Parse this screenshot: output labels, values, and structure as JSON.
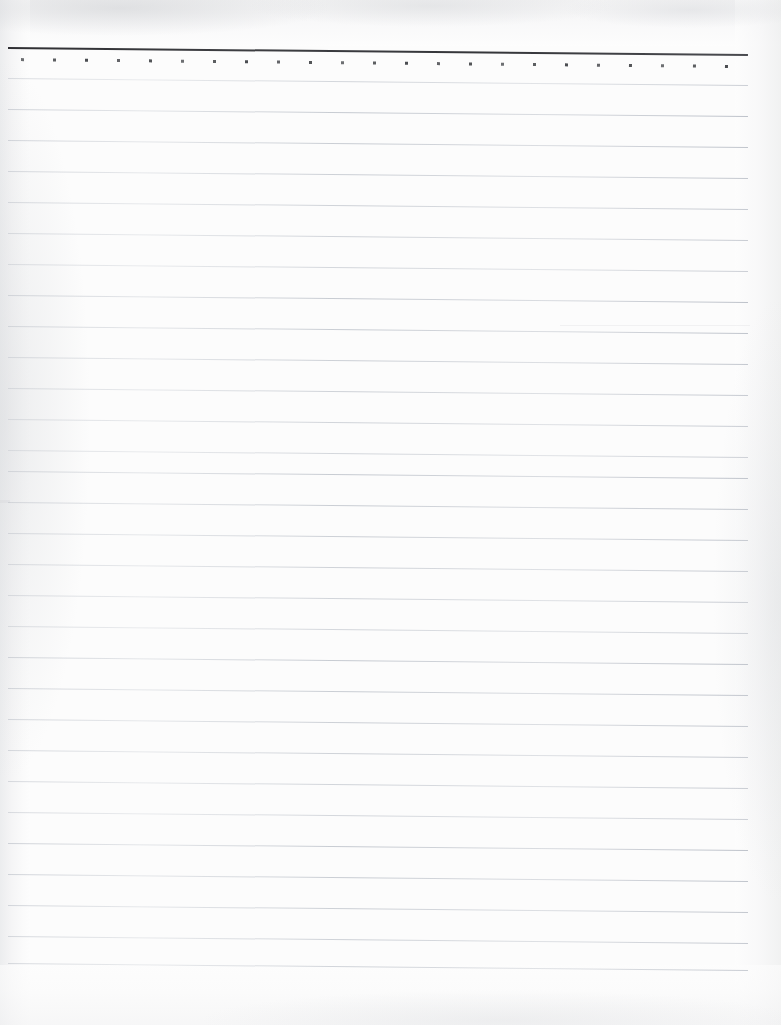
{
  "document": {
    "kind": "scanned-lined-notebook-page",
    "title": "Blank Ruled Notebook Page",
    "width_px": 781,
    "height_px": 1025,
    "background_color": "#fcfcfc",
    "content_text": "",
    "notes": "Blank ruled paper scan: one dark header rule with a row of small square dots beneath it, followed by evenly spaced faint horizontal ruling lines. No handwriting, text, or other marks present."
  },
  "colors": {
    "paper": "#fcfcfc",
    "header_rule": "#35363a",
    "dot": "#44464a",
    "ruled_line": "#c9ccd2",
    "scan_edge_shadow": "#e9eaec"
  },
  "geometry": {
    "tilt_degrees": 0.55,
    "rule_left_x": 8,
    "rule_width": 740,
    "header_rule_y": 47,
    "dot_row_y": 58,
    "dot_start_x": 21,
    "dot_spacing": 32,
    "dot_count": 23,
    "first_line_y": 78,
    "line_spacing": 31.3,
    "line_count": 29
  },
  "header_rule": {
    "label": "Header Rule",
    "thickness_px": 2
  },
  "dot_row": {
    "label": "Dot Marker Row",
    "dots": [
      {
        "index": 1
      },
      {
        "index": 2
      },
      {
        "index": 3
      },
      {
        "index": 4
      },
      {
        "index": 5
      },
      {
        "index": 6
      },
      {
        "index": 7
      },
      {
        "index": 8
      },
      {
        "index": 9
      },
      {
        "index": 10
      },
      {
        "index": 11
      },
      {
        "index": 12
      },
      {
        "index": 13
      },
      {
        "index": 14
      },
      {
        "index": 15
      },
      {
        "index": 16
      },
      {
        "index": 17
      },
      {
        "index": 18
      },
      {
        "index": 19
      },
      {
        "index": 20
      },
      {
        "index": 21
      },
      {
        "index": 22
      },
      {
        "index": 23
      }
    ]
  },
  "ruled_lines": {
    "label": "Ruled Writing Lines",
    "lines": [
      {
        "index": 1,
        "y": 78
      },
      {
        "index": 2,
        "y": 109
      },
      {
        "index": 3,
        "y": 140
      },
      {
        "index": 4,
        "y": 171
      },
      {
        "index": 5,
        "y": 202
      },
      {
        "index": 6,
        "y": 233
      },
      {
        "index": 7,
        "y": 264
      },
      {
        "index": 8,
        "y": 295
      },
      {
        "index": 9,
        "y": 326
      },
      {
        "index": 10,
        "y": 357
      },
      {
        "index": 11,
        "y": 388
      },
      {
        "index": 12,
        "y": 419
      },
      {
        "index": 13,
        "y": 450
      },
      {
        "index": 14,
        "y": 471
      },
      {
        "index": 15,
        "y": 502
      },
      {
        "index": 16,
        "y": 533
      },
      {
        "index": 17,
        "y": 564
      },
      {
        "index": 18,
        "y": 595
      },
      {
        "index": 19,
        "y": 626
      },
      {
        "index": 20,
        "y": 657
      },
      {
        "index": 21,
        "y": 688
      },
      {
        "index": 22,
        "y": 719
      },
      {
        "index": 23,
        "y": 750
      },
      {
        "index": 24,
        "y": 781
      },
      {
        "index": 25,
        "y": 812
      },
      {
        "index": 26,
        "y": 843
      },
      {
        "index": 27,
        "y": 874
      },
      {
        "index": 28,
        "y": 905
      },
      {
        "index": 29,
        "y": 936
      },
      {
        "index": 30,
        "y": 963
      }
    ]
  },
  "margins": {
    "right_blank_label": "Right Page Margin",
    "bottom_blank_label": "Bottom Page Margin"
  }
}
